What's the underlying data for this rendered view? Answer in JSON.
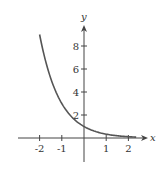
{
  "chart_data": {
    "type": "line",
    "title": "",
    "xlabel": "x",
    "ylabel": "y",
    "function": "y = 3^(-x)",
    "xlim": [
      -2.9,
      2.8
    ],
    "ylim": [
      -2,
      9.8
    ],
    "x_ticks": [
      -2,
      -1,
      1,
      2
    ],
    "x_tick_labels": [
      "-2",
      "-1",
      "1",
      "2"
    ],
    "y_ticks": [
      2,
      4,
      6,
      8
    ],
    "y_tick_labels": [
      "2",
      "4",
      "6",
      "8"
    ],
    "grid": false,
    "series": [
      {
        "name": "curve",
        "color": "#555555",
        "x": [
          -2,
          -1.5,
          -1,
          -0.5,
          0,
          0.5,
          1,
          1.5,
          2,
          2.4
        ],
        "y": [
          9.7,
          5.2,
          3.0,
          1.73,
          1.0,
          0.58,
          0.33,
          0.19,
          0.11,
          0.07
        ]
      }
    ]
  },
  "axes": {
    "x_label": "x",
    "y_label": "y",
    "color": "#444444"
  }
}
